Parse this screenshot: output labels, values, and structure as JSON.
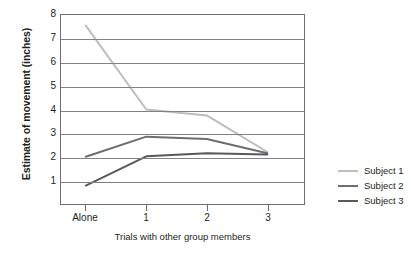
{
  "chart_data": {
    "type": "line",
    "title": "",
    "xlabel": "Trials with other group members",
    "ylabel": "Estimate of movement (inches)",
    "categories": [
      "Alone",
      "1",
      "2",
      "3"
    ],
    "xtick_labels": [
      "Alone",
      "1",
      "2",
      "3"
    ],
    "ytick_labels": [
      "1",
      "2",
      "3",
      "4",
      "5",
      "6",
      "7",
      "8"
    ],
    "ylim": [
      0,
      8
    ],
    "yticks": [
      1,
      2,
      3,
      4,
      5,
      6,
      7,
      8
    ],
    "grid": "horizontal",
    "legend_position": "right",
    "series": [
      {
        "name": "Subject 1",
        "color": "#bcbec0",
        "values": [
          7.55,
          4.0,
          3.75,
          2.2
        ]
      },
      {
        "name": "Subject 2",
        "color": "#6d6e71",
        "values": [
          2.0,
          2.85,
          2.75,
          2.15
        ]
      },
      {
        "name": "Subject 3",
        "color": "#58595b",
        "values": [
          0.78,
          2.02,
          2.15,
          2.1
        ]
      }
    ]
  },
  "legend": {
    "entries": [
      {
        "label": "Subject 1",
        "color": "#bcbec0"
      },
      {
        "label": "Subject 2",
        "color": "#6d6e71"
      },
      {
        "label": "Subject 3",
        "color": "#58595b"
      }
    ]
  },
  "colors": {
    "axis": "#6d6e71",
    "gridline": "#808285",
    "text": "#231f20",
    "background": "#ffffff"
  }
}
